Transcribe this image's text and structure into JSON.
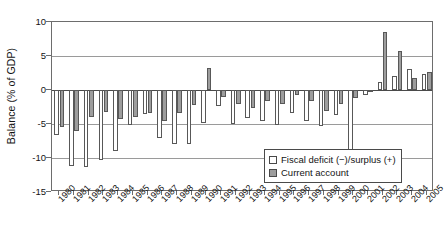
{
  "chart_data": {
    "type": "bar",
    "title": "",
    "subtitle": "",
    "xlabel": "",
    "ylabel": "Balance (% of GDP)",
    "categories": [
      "1980",
      "1981",
      "1982",
      "1983",
      "1984",
      "1985",
      "1986",
      "1987",
      "1988",
      "1989",
      "1990",
      "1991",
      "1992",
      "1993",
      "1994",
      "1995",
      "1996",
      "1997",
      "1998",
      "1999",
      "2000",
      "2001",
      "2002",
      "2003",
      "2004",
      "2005"
    ],
    "ylim": [
      -15,
      10
    ],
    "yticks": [
      10,
      5,
      0,
      -5,
      -10,
      -15
    ],
    "ytick_labels": [
      "10",
      "5",
      "0",
      "-5",
      "-10",
      "-15"
    ],
    "grid": "horizontal",
    "legend_position": "bottom-right",
    "series": [
      {
        "name": "Fiscal deficit (−)/surplus (+)",
        "color": "#ffffff",
        "edge_color": "#585858",
        "values": [
          -6.6,
          -11.2,
          -11.3,
          -10.3,
          -8.9,
          -5.1,
          -3.5,
          -7.1,
          -8.0,
          -8.0,
          -4.9,
          -2.3,
          -5.0,
          -4.1,
          -4.6,
          -5.2,
          -3.4,
          -4.5,
          -5.3,
          -3.7,
          -9.2,
          -0.7,
          1.2,
          2.0,
          3.1,
          2.4
        ]
      },
      {
        "name": "Current account",
        "color": "#9d9d9d",
        "edge_color": "#585858",
        "values": [
          -5.4,
          -6.1,
          -4.0,
          -3.3,
          -4.2,
          -4.0,
          -3.4,
          -4.5,
          -3.4,
          -2.2,
          3.2,
          -1.1,
          -2.1,
          -2.6,
          -1.6,
          -2.0,
          -0.8,
          -1.6,
          -3.1,
          -2.0,
          -1.2,
          -0.3,
          8.6,
          5.7,
          1.8,
          2.7
        ]
      }
    ]
  },
  "legend": {
    "items": [
      {
        "label": "Fiscal deficit (−)/surplus (+)",
        "swatch": "fiscal"
      },
      {
        "label": "Current account",
        "swatch": "current"
      }
    ]
  },
  "axis": {
    "y_title": "Balance (% of GDP)"
  }
}
